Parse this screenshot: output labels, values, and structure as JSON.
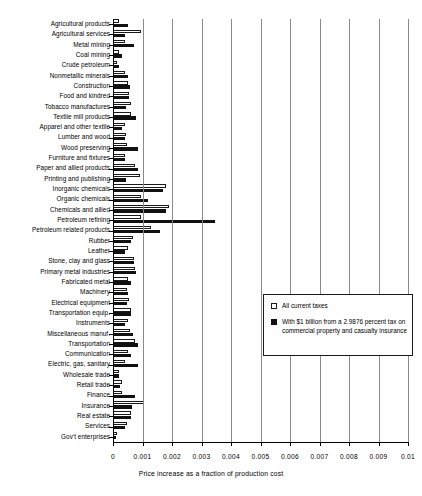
{
  "chart_data": {
    "type": "bar",
    "orientation": "horizontal",
    "title": "",
    "xlabel": "Price increase as a fraction of production cost",
    "ylabel": "",
    "xlim": [
      0,
      0.01
    ],
    "xticks": [
      0,
      0.001,
      0.002,
      0.003,
      0.004,
      0.005,
      0.006,
      0.007,
      0.008,
      0.009,
      0.01
    ],
    "xtick_labels": [
      "0",
      "0.001",
      "0.002",
      "0.003",
      "0.004",
      "0.005",
      "0.006",
      "0.007",
      "0.008",
      "0.009",
      "0.01"
    ],
    "grid": true,
    "grid_axis": "x",
    "legend_position": "center-right",
    "categories": [
      "Agricultural products",
      "Agricultural services",
      "Metal mining",
      "Coal mining",
      "Crude petroleum",
      "Nonmetallic minerals",
      "Construction",
      "Food and kindred",
      "Tobacco manufactures",
      "Textile mill products",
      "Apparel and other textile",
      "Lumber and wood",
      "Wood preserving",
      "Furniture and fixtures",
      "Paper and allied products",
      "Printing and publishing",
      "Inorganic chemicals",
      "Organic chemicals",
      "Chemicals and allied",
      "Petroleum refining",
      "Petroleum related products",
      "Rubber",
      "Leather",
      "Stone, clay and glass",
      "Primary metal industries",
      "Fabricated metal",
      "Machinery",
      "Electrical equipment",
      "Transportation equip.",
      "Instruments",
      "Miscellaneous manuf.",
      "Transportation",
      "Communication",
      "Electric, gas, sanitary",
      "Wholesale trade",
      "Retail trade",
      "Finance",
      "Insurance",
      "Real estate",
      "Services",
      "Gov't enterprises"
    ],
    "series": [
      {
        "name": "All current taxes",
        "color": "#ffffff",
        "edge_color": "#1a1a1a",
        "values": [
          0.00022,
          0.00095,
          0.00042,
          0.00022,
          0.00012,
          0.0004,
          0.0005,
          0.00055,
          0.0006,
          0.00062,
          0.0004,
          0.00045,
          0.00048,
          0.0004,
          0.00075,
          0.0009,
          0.0018,
          0.00095,
          0.0019,
          0.00095,
          0.0013,
          0.00068,
          0.0005,
          0.0007,
          0.00075,
          0.00052,
          0.00048,
          0.00055,
          0.0006,
          0.0005,
          0.00058,
          0.00075,
          0.0005,
          0.00042,
          0.0002,
          0.00032,
          0.00032,
          0.00105,
          0.0006,
          0.00048,
          0.00012
        ]
      },
      {
        "name": "With $1 billion from a 2.9876 percent tax on commercial property and casualty insurance",
        "color": "#111111",
        "edge_color": "#111111",
        "values": [
          0.0005,
          0.00042,
          0.00072,
          0.00032,
          0.0002,
          0.00052,
          0.00058,
          0.00055,
          0.00045,
          0.00078,
          0.0003,
          0.0004,
          0.00085,
          0.00042,
          0.00085,
          0.00045,
          0.0017,
          0.00118,
          0.0018,
          0.00345,
          0.0016,
          0.00062,
          0.0004,
          0.0007,
          0.00078,
          0.0006,
          0.00052,
          0.00048,
          0.00062,
          0.00042,
          0.00068,
          0.00085,
          0.00062,
          0.00085,
          0.00022,
          0.00025,
          0.00075,
          0.00065,
          0.00062,
          0.0004,
          0.0001
        ]
      }
    ]
  },
  "legend": {
    "entries": [
      {
        "label": "All current taxes",
        "swatch": "white"
      },
      {
        "label": "With $1 billion from a 2.9876 percent tax on commercial property and casualty insurance",
        "swatch": "black"
      }
    ]
  }
}
